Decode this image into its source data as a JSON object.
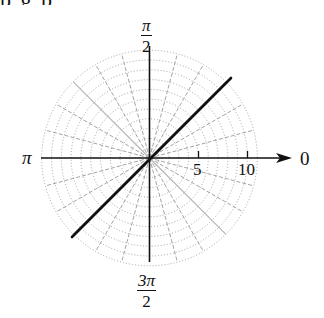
{
  "figure": {
    "top_clipped_text": "p      g        p",
    "axis_labels": {
      "right": "0",
      "top": {
        "numerator": "π",
        "denominator": "2"
      },
      "left": "π",
      "bottom": {
        "numerator": "3π",
        "denominator": "2"
      }
    },
    "ticks": [
      {
        "value": 5,
        "label": "5"
      },
      {
        "value": 10,
        "label": "10"
      }
    ],
    "grid": {
      "type": "polar",
      "max_radius": 11,
      "radial_step": 1,
      "angle_step_degrees": 15,
      "solid_angles_degrees": [
        45,
        135,
        225,
        315
      ],
      "circle_style": "dotted",
      "radial_style": "dashed",
      "grid_color": "#9a9a9a"
    },
    "curve": {
      "description": "line θ = π/4 through the pole",
      "theta": "π/4",
      "r_range": [
        -11.5,
        11.5
      ],
      "color": "#111111"
    },
    "colors": {
      "axis": "#111111",
      "background": "#ffffff"
    }
  }
}
